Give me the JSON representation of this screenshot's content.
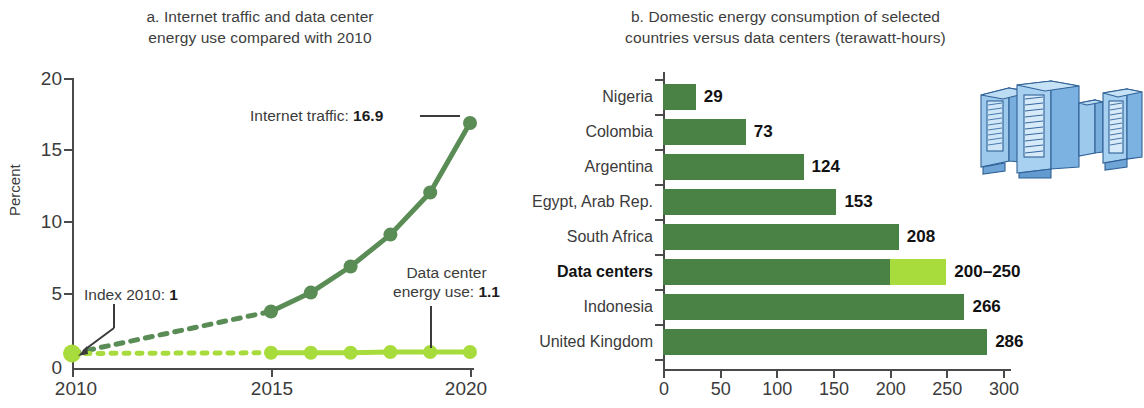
{
  "chart_data": [
    {
      "type": "line",
      "panel": "a",
      "title": "a. Internet traffic and data center energy use compared with 2010",
      "title_line1": "a. Internet traffic and data center",
      "title_line2": "energy use compared with 2010",
      "xlabel": "",
      "ylabel": "Percent",
      "ylim": [
        0,
        20
      ],
      "xlim": [
        2010,
        2020
      ],
      "yticks": [
        "20",
        "15",
        "10",
        "5",
        "0"
      ],
      "ytick_values": [
        20,
        15,
        10,
        5,
        0
      ],
      "xticks": [
        "2010",
        "2015",
        "2020"
      ],
      "xtick_values": [
        2010,
        2015,
        2020
      ],
      "grid": false,
      "legend_position": "annotations",
      "x": [
        2010,
        2015,
        2016,
        2017,
        2018,
        2019,
        2020
      ],
      "series": [
        {
          "name": "Internet traffic",
          "color": "#5a8c55",
          "values": [
            1,
            3.9,
            5.2,
            7.0,
            9.2,
            12.1,
            16.9
          ],
          "dashed_from": 2010,
          "dashed_to": 2015,
          "end_label": "16.9"
        },
        {
          "name": "Data center energy use",
          "color": "#a8dc3c",
          "values": [
            1,
            1.05,
            1.05,
            1.05,
            1.1,
            1.1,
            1.1
          ],
          "dashed_from": 2010,
          "dashed_to": 2015,
          "end_label": "1.1"
        }
      ],
      "annotations": [
        {
          "id": "index-2010",
          "text_prefix": "Index 2010: ",
          "text_value": "1"
        },
        {
          "id": "internet-traffic",
          "text_prefix": "Internet traffic: ",
          "text_value": "16.9"
        },
        {
          "id": "data-center",
          "text_line1": "Data center",
          "text_prefix": "energy use: ",
          "text_value": "1.1"
        }
      ]
    },
    {
      "type": "bar",
      "panel": "b",
      "orientation": "horizontal",
      "title": "b. Domestic energy consumption of selected countries versus data centers (terawatt-hours)",
      "title_line1": "b. Domestic energy consumption of selected",
      "title_line2": "countries versus data centers (terawatt-hours)",
      "xlabel": "",
      "ylabel": "",
      "xlim": [
        0,
        300
      ],
      "xticks": [
        "0",
        "50",
        "100",
        "150",
        "200",
        "250",
        "300"
      ],
      "xtick_values": [
        0,
        50,
        100,
        150,
        200,
        250,
        300
      ],
      "grid": false,
      "categories": [
        "Nigeria",
        "Colombia",
        "Argentina",
        "Egypt, Arab Rep.",
        "South Africa",
        "Data centers",
        "Indonesia",
        "United Kingdom"
      ],
      "values": [
        29,
        73,
        124,
        153,
        208,
        225,
        266,
        286
      ],
      "bars": [
        {
          "category": "Nigeria",
          "value": 29,
          "label": "29",
          "highlight": false,
          "range": null
        },
        {
          "category": "Colombia",
          "value": 73,
          "label": "73",
          "highlight": false,
          "range": null
        },
        {
          "category": "Argentina",
          "value": 124,
          "label": "124",
          "highlight": false,
          "range": null
        },
        {
          "category": "Egypt, Arab Rep.",
          "value": 153,
          "label": "153",
          "highlight": false,
          "range": null
        },
        {
          "category": "South Africa",
          "value": 208,
          "label": "208",
          "highlight": false,
          "range": null
        },
        {
          "category": "Data centers",
          "value": 200,
          "label": "200–250",
          "highlight": true,
          "range": [
            200,
            250
          ]
        },
        {
          "category": "Indonesia",
          "value": 266,
          "label": "266",
          "highlight": false,
          "range": null
        },
        {
          "category": "United Kingdom",
          "value": 286,
          "label": "286",
          "highlight": false,
          "range": null
        }
      ],
      "illustration": "server-racks"
    }
  ],
  "colors": {
    "dark_green": "#4a8246",
    "line_green": "#5a8c55",
    "light_green": "#a8dc3c",
    "axis": "#4a4a4a",
    "text": "#3b3b3b",
    "server_blue": "#8fc0e8",
    "server_blue_dark": "#5f93c9"
  }
}
